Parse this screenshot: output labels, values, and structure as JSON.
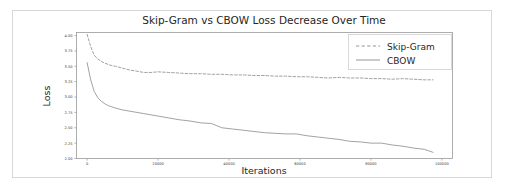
{
  "figure": {
    "background_color": "#ffffff",
    "border_color": "#d8d8d8",
    "line_color": "#8a8a8a"
  },
  "chart_data": {
    "type": "line",
    "title": "Skip-Gram vs CBOW Loss Decrease Over Time",
    "xlabel": "Iterations",
    "ylabel": "Loss",
    "grid": false,
    "legend_position": "upper right",
    "xlim": [
      -3000,
      103000
    ],
    "ylim": [
      2.0,
      4.05
    ],
    "xticks": [
      0,
      20000,
      40000,
      60000,
      80000,
      100000
    ],
    "xtick_labels": [
      "0",
      "20000",
      "40000",
      "60000",
      "80000",
      "100000"
    ],
    "yticks": [
      2.0,
      2.25,
      2.5,
      2.75,
      3.0,
      3.25,
      3.5,
      3.75,
      4.0
    ],
    "ytick_labels": [
      "2.00",
      "2.25",
      "2.50",
      "2.75",
      "3.00",
      "3.25",
      "3.50",
      "3.75",
      "4.00"
    ],
    "x": [
      0,
      1000,
      2000,
      3000,
      4000,
      5000,
      6000,
      7000,
      8000,
      10000,
      12000,
      14000,
      16000,
      18000,
      20000,
      23000,
      26000,
      29000,
      32000,
      35000,
      38000,
      41000,
      44000,
      47000,
      50000,
      53000,
      56000,
      59000,
      62000,
      65000,
      68000,
      71000,
      74000,
      77000,
      80000,
      83000,
      86000,
      89000,
      92000,
      95000,
      97500
    ],
    "series": [
      {
        "name": "Skip-Gram",
        "style": "dashed",
        "values": [
          4.02,
          3.82,
          3.68,
          3.62,
          3.58,
          3.55,
          3.53,
          3.51,
          3.5,
          3.47,
          3.44,
          3.42,
          3.4,
          3.4,
          3.41,
          3.4,
          3.39,
          3.38,
          3.38,
          3.37,
          3.37,
          3.36,
          3.36,
          3.35,
          3.35,
          3.34,
          3.34,
          3.33,
          3.33,
          3.32,
          3.31,
          3.32,
          3.31,
          3.31,
          3.3,
          3.3,
          3.29,
          3.3,
          3.29,
          3.28,
          3.28
        ]
      },
      {
        "name": "CBOW",
        "style": "solid",
        "values": [
          3.56,
          3.28,
          3.09,
          2.99,
          2.93,
          2.89,
          2.86,
          2.84,
          2.82,
          2.79,
          2.77,
          2.75,
          2.73,
          2.71,
          2.69,
          2.66,
          2.63,
          2.61,
          2.58,
          2.57,
          2.5,
          2.48,
          2.46,
          2.44,
          2.42,
          2.41,
          2.4,
          2.4,
          2.37,
          2.35,
          2.33,
          2.31,
          2.28,
          2.27,
          2.25,
          2.25,
          2.22,
          2.2,
          2.17,
          2.15,
          2.1
        ]
      }
    ]
  },
  "legend": {
    "entries": [
      {
        "label": "Skip-Gram",
        "style": "dashed"
      },
      {
        "label": "CBOW",
        "style": "solid"
      }
    ]
  }
}
